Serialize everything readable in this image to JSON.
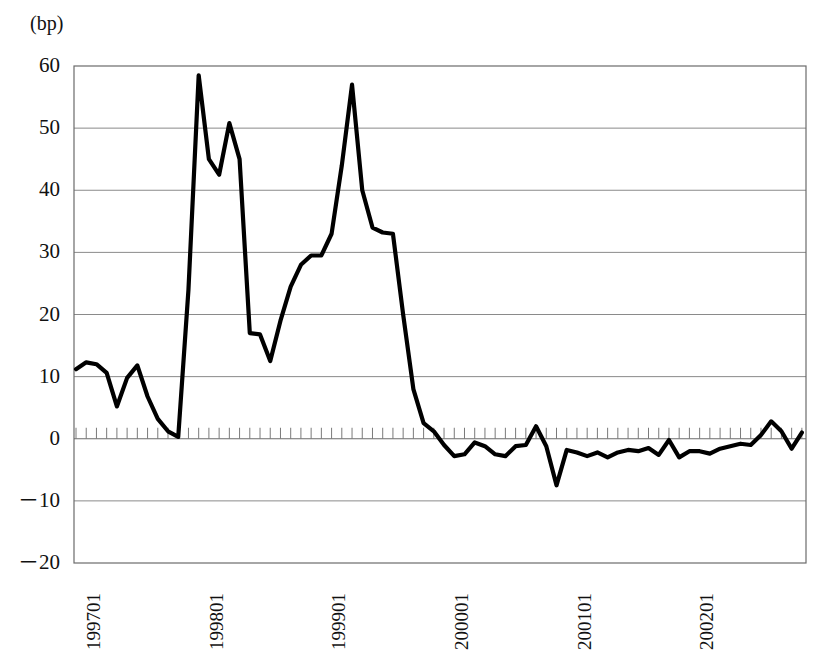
{
  "chart_data": {
    "type": "line",
    "title": "",
    "subtitle": "",
    "unit_label": "(bp)",
    "xlabel": "",
    "ylabel": "",
    "ylim": [
      -20,
      60
    ],
    "yticks": [
      60,
      50,
      40,
      30,
      20,
      10,
      0,
      -10,
      -20
    ],
    "ytick_labels": [
      "60",
      "50",
      "40",
      "30",
      "20",
      "10",
      "0",
      "－10",
      "－20"
    ],
    "grid": true,
    "grid_axis": "y",
    "legend": "none",
    "minor_ticks": "monthly",
    "line_color": "#000000",
    "grid_color": "#8a8a8a",
    "frame_color": "#6b6b6b",
    "xtick_labels": [
      "199701",
      "199801",
      "199901",
      "200001",
      "200101",
      "200201"
    ],
    "xtick_values": [
      "199701",
      "199801",
      "199901",
      "200001",
      "200101",
      "200201"
    ],
    "x": [
      "199701",
      "199702",
      "199703",
      "199704",
      "199705",
      "199706",
      "199707",
      "199708",
      "199709",
      "199710",
      "199711",
      "199712",
      "199801",
      "199802",
      "199803",
      "199804",
      "199805",
      "199806",
      "199807",
      "199808",
      "199809",
      "199810",
      "199811",
      "199812",
      "199901",
      "199902",
      "199903",
      "199904",
      "199905",
      "199906",
      "199907",
      "199908",
      "199909",
      "199910",
      "199911",
      "199912",
      "200001",
      "200002",
      "200003",
      "200004",
      "200005",
      "200006",
      "200007",
      "200008",
      "200009",
      "200010",
      "200011",
      "200012",
      "200101",
      "200102",
      "200103",
      "200104",
      "200105",
      "200106",
      "200107",
      "200108",
      "200109",
      "200110",
      "200111",
      "200112",
      "200201",
      "200202",
      "200203",
      "200204",
      "200205",
      "200206",
      "200207",
      "200208",
      "200209",
      "200210",
      "200211",
      "200212"
    ],
    "values": [
      11.2,
      12.3,
      12.0,
      10.6,
      5.2,
      9.8,
      11.8,
      6.8,
      3.2,
      1.2,
      0.3,
      24.0,
      58.5,
      45.0,
      42.5,
      50.8,
      45.0,
      17.0,
      16.8,
      12.5,
      19.0,
      24.5,
      28.0,
      29.5,
      29.5,
      33.0,
      44.0,
      57.0,
      40.0,
      34.0,
      33.2,
      33.0,
      20.0,
      8.0,
      2.5,
      1.2,
      -1.0,
      -2.8,
      -2.5,
      -0.6,
      -1.2,
      -2.5,
      -2.8,
      -1.2,
      -1.0,
      2.0,
      -1.2,
      -7.5,
      -1.8,
      -2.2,
      -2.8,
      -2.2,
      -3.0,
      -2.2,
      -1.8,
      -2.0,
      -1.5,
      -2.6,
      -0.2,
      -3.0,
      -2.0,
      -2.0,
      -2.4,
      -1.6,
      -1.2,
      -0.8,
      -1.0,
      0.6,
      2.8,
      1.2,
      -1.6,
      1.0
    ]
  }
}
